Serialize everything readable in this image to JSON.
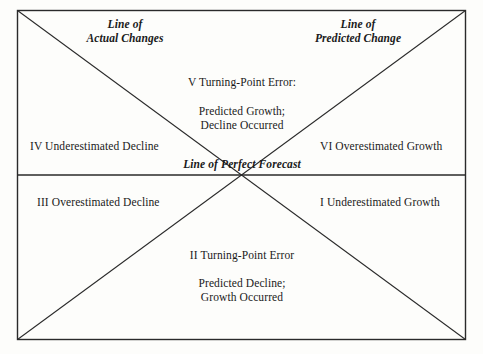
{
  "figure": {
    "kind": "forecast-error-quadrant-diagram",
    "background_color": "#fdfdfb",
    "line_color": "#2a2a2a",
    "text_color": "#1a1a1a"
  },
  "frame": {
    "left": 17,
    "top": 10,
    "right": 466,
    "bottom": 340
  },
  "lines": {
    "horizontal_midline_y": 175,
    "center_x": 241.5,
    "center_y": 175,
    "line_of_actual_changes": {
      "x1": 17,
      "y1": 10,
      "x2": 466,
      "y2": 340
    },
    "line_of_predicted_change": {
      "x1": 466,
      "y1": 10,
      "x2": 17,
      "y2": 340
    },
    "line_of_perfect_forecast": {
      "x1": 17,
      "y1": 175,
      "x2": 466,
      "y2": 175
    }
  },
  "labels": {
    "line_of_actual_changes": "Line of\nActual Changes",
    "line_of_predicted_change": "Line of\nPredicted Change",
    "line_of_perfect_forecast": "Line of Perfect Forecast",
    "turning_point_v_title": "V Turning-Point Error:",
    "turning_point_v_body": "Predicted Growth;\nDecline Occurred",
    "quadrant_iv": "IV Underestimated Decline",
    "quadrant_vi": "VI Overestimated Growth",
    "quadrant_iii": "III Overestimated Decline",
    "quadrant_i": "I Underestimated Growth",
    "turning_point_ii_title": "II Turning-Point Error",
    "turning_point_ii_body": "Predicted Decline;\nGrowth Occurred"
  }
}
